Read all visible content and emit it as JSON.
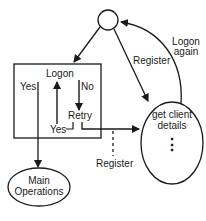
{
  "diagram": {
    "type": "state-flow",
    "nodes": {
      "start": {
        "label": ""
      },
      "logon_box": {
        "title": "Logon",
        "yes_left": "Yes",
        "no": "No",
        "retry": "Retry",
        "yes_retry": "Yes"
      },
      "get_client": {
        "line1": "get client",
        "line2": "details",
        "dots": "⋮"
      },
      "main_ops": {
        "line1": "Main",
        "line2": "Operations"
      }
    },
    "edges": {
      "register_top": "Register",
      "logon_again_1": "Logon",
      "logon_again_2": "again",
      "register_bottom": "Register"
    },
    "colors": {
      "stroke": "#1a1a1a",
      "background": "#ffffff"
    }
  }
}
